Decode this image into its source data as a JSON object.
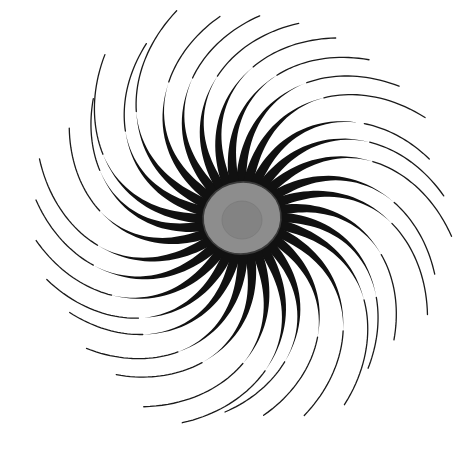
{
  "canvas": {
    "width": 475,
    "height": 464,
    "background_color": "#ffffff",
    "title": "Radiolarian / sunburst spicule organism illustration"
  },
  "figure": {
    "name": "spiral-spiculed-radiolarian",
    "center_x": 242,
    "center_y": 218
  },
  "central_capsule": {
    "name": "central-capsule",
    "fill_color": "#8d8d8d",
    "stroke_color": "#3a3a3a",
    "stroke_width": 1.6,
    "rx": 39,
    "ry": 36,
    "rotation_deg": -8
  },
  "nucleus": {
    "name": "nucleus-blob",
    "fill_color": "#838383",
    "stroke_color": "#7a7a7a",
    "stroke_width": 0.8,
    "rx": 20,
    "ry": 19,
    "offset_x": 0,
    "offset_y": 2
  },
  "cortical_disk": {
    "name": "cortical-gray-disk",
    "fill_color": "#8c8c8c",
    "outer_radius": 76,
    "inner_radius": 34,
    "note": "Gray disk visible as wedge sectors between the black spines"
  },
  "spines": {
    "name": "spine-ray-set",
    "count": 32,
    "fill_color": "#111111",
    "hair_color": "#1a1a1a",
    "hair_width": 1.3,
    "base_radius": 30,
    "shoulder_radius": 54,
    "body_end_radius": 150,
    "hair_end_radius": 205,
    "base_half_width_deg": 4.2,
    "shoulder_half_width_deg": 3.4,
    "spiral_twist_deg": 52,
    "start_angle_deg": -92,
    "radius_jitter": [
      1.0,
      0.97,
      1.03,
      0.99,
      0.95,
      1.02,
      1.0,
      0.96,
      1.04,
      0.98,
      1.01,
      0.94,
      1.0,
      1.03,
      0.97,
      1.0,
      0.99,
      1.02,
      0.96,
      1.01,
      1.04,
      0.98,
      0.95,
      1.0,
      1.02,
      0.97,
      1.0,
      1.03,
      0.99,
      0.96,
      1.01,
      0.98
    ],
    "hair_jitter": [
      1.0,
      1.05,
      0.93,
      1.0,
      1.08,
      0.96,
      1.02,
      0.99,
      0.92,
      1.06,
      1.0,
      1.03,
      0.95,
      1.01,
      1.07,
      0.98,
      1.0,
      0.94,
      1.04,
      1.0,
      0.97,
      1.05,
      1.0,
      0.93,
      1.02,
      1.0,
      1.06,
      0.96,
      1.0,
      1.03,
      0.98,
      1.01
    ]
  },
  "palette": {
    "background": "#ffffff",
    "ink_black": "#111111",
    "mid_gray": "#8c8c8c",
    "dark_gray": "#838383",
    "outline_gray": "#3a3a3a"
  }
}
